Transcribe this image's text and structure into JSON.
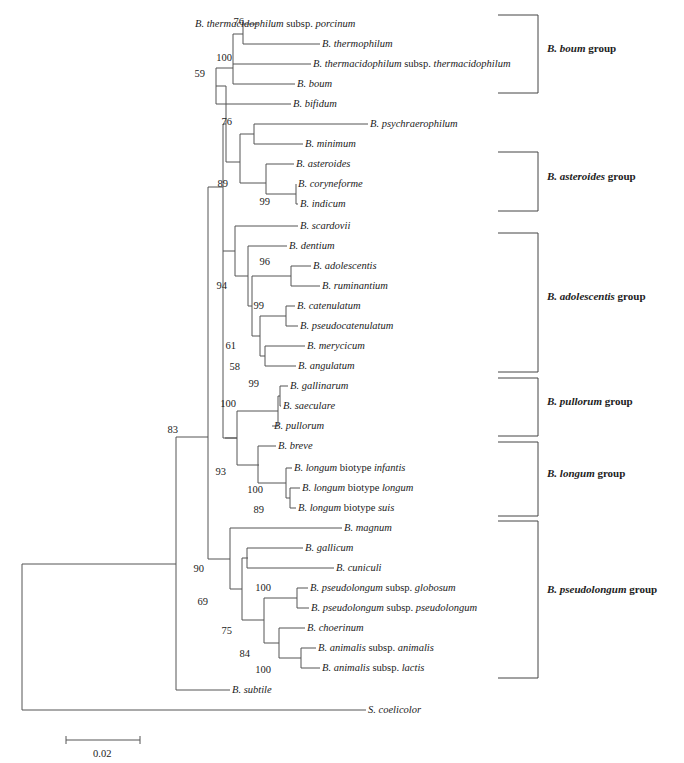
{
  "figure": {
    "type": "phylogenetic-tree",
    "line_color": "#555555",
    "leaves": [
      {
        "id": "porcinum",
        "genus": "B.",
        "species": "thermacidophilum",
        "rank": "subsp.",
        "infra": "porcinum",
        "x": 195,
        "y": 24
      },
      {
        "id": "thermophilum",
        "genus": "B.",
        "species": "thermophilum",
        "rank": "",
        "infra": "",
        "x": 322,
        "y": 44
      },
      {
        "id": "thermacidophilum",
        "genus": "B.",
        "species": "thermacidophilum",
        "rank": "subsp.",
        "infra": "thermacidophilum",
        "x": 313,
        "y": 64
      },
      {
        "id": "boum",
        "genus": "B.",
        "species": "boum",
        "rank": "",
        "infra": "",
        "x": 297,
        "y": 84
      },
      {
        "id": "bifidum",
        "genus": "B.",
        "species": "bifidum",
        "rank": "",
        "infra": "",
        "x": 293,
        "y": 104
      },
      {
        "id": "psychraerophilum",
        "genus": "B.",
        "species": "psychraerophilum",
        "rank": "",
        "infra": "",
        "x": 370,
        "y": 124
      },
      {
        "id": "minimum",
        "genus": "B.",
        "species": "minimum",
        "rank": "",
        "infra": "",
        "x": 305,
        "y": 144
      },
      {
        "id": "asteroides",
        "genus": "B.",
        "species": "asteroides",
        "rank": "",
        "infra": "",
        "x": 296,
        "y": 164
      },
      {
        "id": "coryneforme",
        "genus": "B.",
        "species": "coryneforme",
        "rank": "",
        "infra": "",
        "x": 298,
        "y": 184
      },
      {
        "id": "indicum",
        "genus": "B.",
        "species": "indicum",
        "rank": "",
        "infra": "",
        "x": 300,
        "y": 204
      },
      {
        "id": "scardovii",
        "genus": "B.",
        "species": "scardovii",
        "rank": "",
        "infra": "",
        "x": 300,
        "y": 226
      },
      {
        "id": "dentium",
        "genus": "B.",
        "species": "dentium",
        "rank": "",
        "infra": "",
        "x": 289,
        "y": 246
      },
      {
        "id": "adolescentis",
        "genus": "B.",
        "species": "adolescentis",
        "rank": "",
        "infra": "",
        "x": 313,
        "y": 266
      },
      {
        "id": "ruminantium",
        "genus": "B.",
        "species": "ruminantium",
        "rank": "",
        "infra": "",
        "x": 322,
        "y": 286
      },
      {
        "id": "catenulatum",
        "genus": "B.",
        "species": "catenulatum",
        "rank": "",
        "infra": "",
        "x": 297,
        "y": 306
      },
      {
        "id": "pseudocatenulatum",
        "genus": "B.",
        "species": "pseudocatenulatum",
        "rank": "",
        "infra": "",
        "x": 300,
        "y": 326
      },
      {
        "id": "merycicum",
        "genus": "B.",
        "species": "merycicum",
        "rank": "",
        "infra": "",
        "x": 307,
        "y": 346
      },
      {
        "id": "angulatum",
        "genus": "B.",
        "species": "angulatum",
        "rank": "",
        "infra": "",
        "x": 298,
        "y": 366
      },
      {
        "id": "gallinarum",
        "genus": "B.",
        "species": "gallinarum",
        "rank": "",
        "infra": "",
        "x": 290,
        "y": 386
      },
      {
        "id": "saeculare",
        "genus": "B.",
        "species": "saeculare",
        "rank": "",
        "infra": "",
        "x": 283,
        "y": 406
      },
      {
        "id": "pullorum",
        "genus": "B.",
        "species": "pullorum",
        "rank": "",
        "infra": "",
        "x": 274,
        "y": 426
      },
      {
        "id": "breve",
        "genus": "B.",
        "species": "breve",
        "rank": "",
        "infra": "",
        "x": 278,
        "y": 446
      },
      {
        "id": "longum_infantis",
        "genus": "B.",
        "species": "longum",
        "rank": "biotype",
        "infra": "infantis",
        "x": 294,
        "y": 468
      },
      {
        "id": "longum_longum",
        "genus": "B.",
        "species": "longum",
        "rank": "biotype",
        "infra": "longum",
        "x": 302,
        "y": 488
      },
      {
        "id": "longum_suis",
        "genus": "B.",
        "species": "longum",
        "rank": "biotype",
        "infra": "suis",
        "x": 298,
        "y": 508
      },
      {
        "id": "magnum",
        "genus": "B.",
        "species": "magnum",
        "rank": "",
        "infra": "",
        "x": 344,
        "y": 528
      },
      {
        "id": "gallicum",
        "genus": "B.",
        "species": "gallicum",
        "rank": "",
        "infra": "",
        "x": 305,
        "y": 548
      },
      {
        "id": "cuniculi",
        "genus": "B.",
        "species": "cuniculi",
        "rank": "",
        "infra": "",
        "x": 336,
        "y": 568
      },
      {
        "id": "globosum",
        "genus": "B.",
        "species": "pseudolongum",
        "rank": "subsp.",
        "infra": "globosum",
        "x": 310,
        "y": 588
      },
      {
        "id": "pseudolongum",
        "genus": "B.",
        "species": "pseudolongum",
        "rank": "subsp.",
        "infra": "pseudolongum",
        "x": 311,
        "y": 608
      },
      {
        "id": "choerinum",
        "genus": "B.",
        "species": "choerinum",
        "rank": "",
        "infra": "",
        "x": 307,
        "y": 628
      },
      {
        "id": "animalis",
        "genus": "B.",
        "species": "animalis",
        "rank": "subsp.",
        "infra": "animalis",
        "x": 318,
        "y": 648
      },
      {
        "id": "lactis",
        "genus": "B.",
        "species": "animalis",
        "rank": "subsp.",
        "infra": "lactis",
        "x": 322,
        "y": 668
      },
      {
        "id": "subtile",
        "genus": "B.",
        "species": "subtile",
        "rank": "",
        "infra": "",
        "x": 232,
        "y": 690
      },
      {
        "id": "coelicolor",
        "genus": "S.",
        "species": "coelicolor",
        "rank": "",
        "infra": "",
        "x": 368,
        "y": 710
      }
    ],
    "bootstrap": [
      {
        "value": "76",
        "x": 244,
        "y": 26
      },
      {
        "value": "100",
        "x": 232,
        "y": 62
      },
      {
        "value": "59",
        "x": 205,
        "y": 78
      },
      {
        "value": "76",
        "x": 232,
        "y": 126
      },
      {
        "value": "89",
        "x": 228,
        "y": 188
      },
      {
        "value": "99",
        "x": 270,
        "y": 206
      },
      {
        "value": "96",
        "x": 270,
        "y": 266
      },
      {
        "value": "94",
        "x": 227,
        "y": 290
      },
      {
        "value": "99",
        "x": 264,
        "y": 310
      },
      {
        "value": "61",
        "x": 236,
        "y": 350
      },
      {
        "value": "58",
        "x": 240,
        "y": 371
      },
      {
        "value": "99",
        "x": 259,
        "y": 388
      },
      {
        "value": "100",
        "x": 236,
        "y": 408
      },
      {
        "value": "83",
        "x": 178,
        "y": 434
      },
      {
        "value": "93",
        "x": 226,
        "y": 476
      },
      {
        "value": "100",
        "x": 263,
        "y": 494
      },
      {
        "value": "89",
        "x": 264,
        "y": 514
      },
      {
        "value": "90",
        "x": 204,
        "y": 573
      },
      {
        "value": "69",
        "x": 208,
        "y": 606
      },
      {
        "value": "100",
        "x": 271,
        "y": 592
      },
      {
        "value": "75",
        "x": 232,
        "y": 635
      },
      {
        "value": "84",
        "x": 250,
        "y": 658
      },
      {
        "value": "100",
        "x": 271,
        "y": 674
      }
    ],
    "groups": [
      {
        "name_italic": "B. boum",
        "suffix": " group",
        "top": 15,
        "bottom": 93,
        "label_y": 48
      },
      {
        "name_italic": "B. asteroides",
        "suffix": " group",
        "top": 152,
        "bottom": 211,
        "label_y": 176
      },
      {
        "name_italic": "B. adolescentis",
        "suffix": " group",
        "top": 233,
        "bottom": 372,
        "label_y": 296
      },
      {
        "name_italic": "B. pullorum",
        "suffix": " group",
        "top": 378,
        "bottom": 436,
        "label_y": 401
      },
      {
        "name_italic": "B. longum",
        "suffix": " group",
        "top": 442,
        "bottom": 516,
        "label_y": 473
      },
      {
        "name_italic": "B. pseudolongum",
        "suffix": " group",
        "top": 521,
        "bottom": 678,
        "label_y": 589
      }
    ],
    "scale_bar": {
      "label": "0.02",
      "x1": 66,
      "x2": 140,
      "y": 740
    }
  }
}
